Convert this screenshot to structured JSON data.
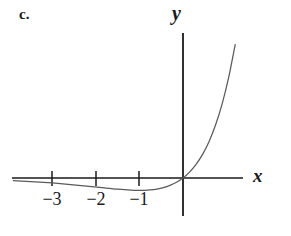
{
  "figure": {
    "part_label": "c.",
    "background_color": "#ffffff",
    "ink_color": "#1a1a1a",
    "curve_color": "#5a5a5a"
  },
  "axes": {
    "x_axis_label": "x",
    "y_axis_label": "y",
    "origin_px": [
      183,
      178
    ],
    "x_axis_start_px": 12,
    "x_axis_end_px": 243,
    "y_axis_top_px": 33,
    "y_axis_bottom_px": 216,
    "pixels_per_unit_x": 43.5,
    "tick_labels": [
      "−3",
      "−2",
      "−1"
    ],
    "tick_values": [
      -3,
      -2,
      -1
    ],
    "tick_positions_px": [
      52,
      96,
      139
    ]
  },
  "chart_data": {
    "type": "line",
    "title": "",
    "subtitle": "",
    "xlabel": "x",
    "ylabel": "y",
    "xlim": [
      -3.9,
      1.4
    ],
    "ylim": [
      -0.9,
      4.2
    ],
    "grid": false,
    "legend": null,
    "x_ticks": [
      -3,
      -2,
      -1
    ],
    "x_tick_labels": [
      "−3",
      "−2",
      "−1"
    ],
    "y_ticks": [],
    "y_tick_labels": [],
    "series": [
      {
        "name": "curve",
        "x": [
          -3.9,
          -3.6,
          -3.3,
          -3.0,
          -2.7,
          -2.4,
          -2.1,
          -1.8,
          -1.5,
          -1.2,
          -1.0,
          -0.9,
          -0.75,
          -0.6,
          -0.45,
          -0.3,
          -0.15,
          0.0,
          0.15,
          0.3,
          0.45,
          0.6,
          0.75,
          0.9,
          1.05,
          1.2
        ],
        "y": [
          -0.079,
          -0.098,
          -0.122,
          -0.149,
          -0.181,
          -0.218,
          -0.257,
          -0.298,
          -0.335,
          -0.361,
          -0.368,
          -0.366,
          -0.354,
          -0.329,
          -0.287,
          -0.222,
          -0.129,
          0.0,
          0.174,
          0.405,
          0.706,
          1.093,
          1.588,
          2.214,
          3.001,
          3.984
        ],
        "annotation": "minimum near x = -1"
      }
    ]
  }
}
